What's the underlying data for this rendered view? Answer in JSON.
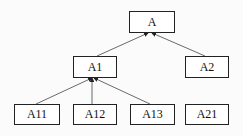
{
  "nodes": [
    {
      "id": "A",
      "label": "A",
      "x": 129,
      "y": 11,
      "w": 46,
      "h": 22
    },
    {
      "id": "A1",
      "label": "A1",
      "x": 73,
      "y": 56,
      "w": 44,
      "h": 22
    },
    {
      "id": "A2",
      "label": "A2",
      "x": 185,
      "y": 56,
      "w": 44,
      "h": 22
    },
    {
      "id": "A11",
      "label": "A11",
      "x": 14,
      "y": 104,
      "w": 46,
      "h": 21
    },
    {
      "id": "A12",
      "label": "A12",
      "x": 73,
      "y": 104,
      "w": 44,
      "h": 21
    },
    {
      "id": "A13",
      "label": "A13",
      "x": 130,
      "y": 104,
      "w": 45,
      "h": 21
    },
    {
      "id": "A21",
      "label": "A21",
      "x": 185,
      "y": 104,
      "w": 44,
      "h": 21
    }
  ],
  "edges": [
    {
      "from": "A1",
      "to": "A"
    },
    {
      "from": "A2",
      "to": "A"
    },
    {
      "from": "A11",
      "to": "A1"
    },
    {
      "from": "A12",
      "to": "A1"
    },
    {
      "from": "A13",
      "to": "A1"
    }
  ]
}
